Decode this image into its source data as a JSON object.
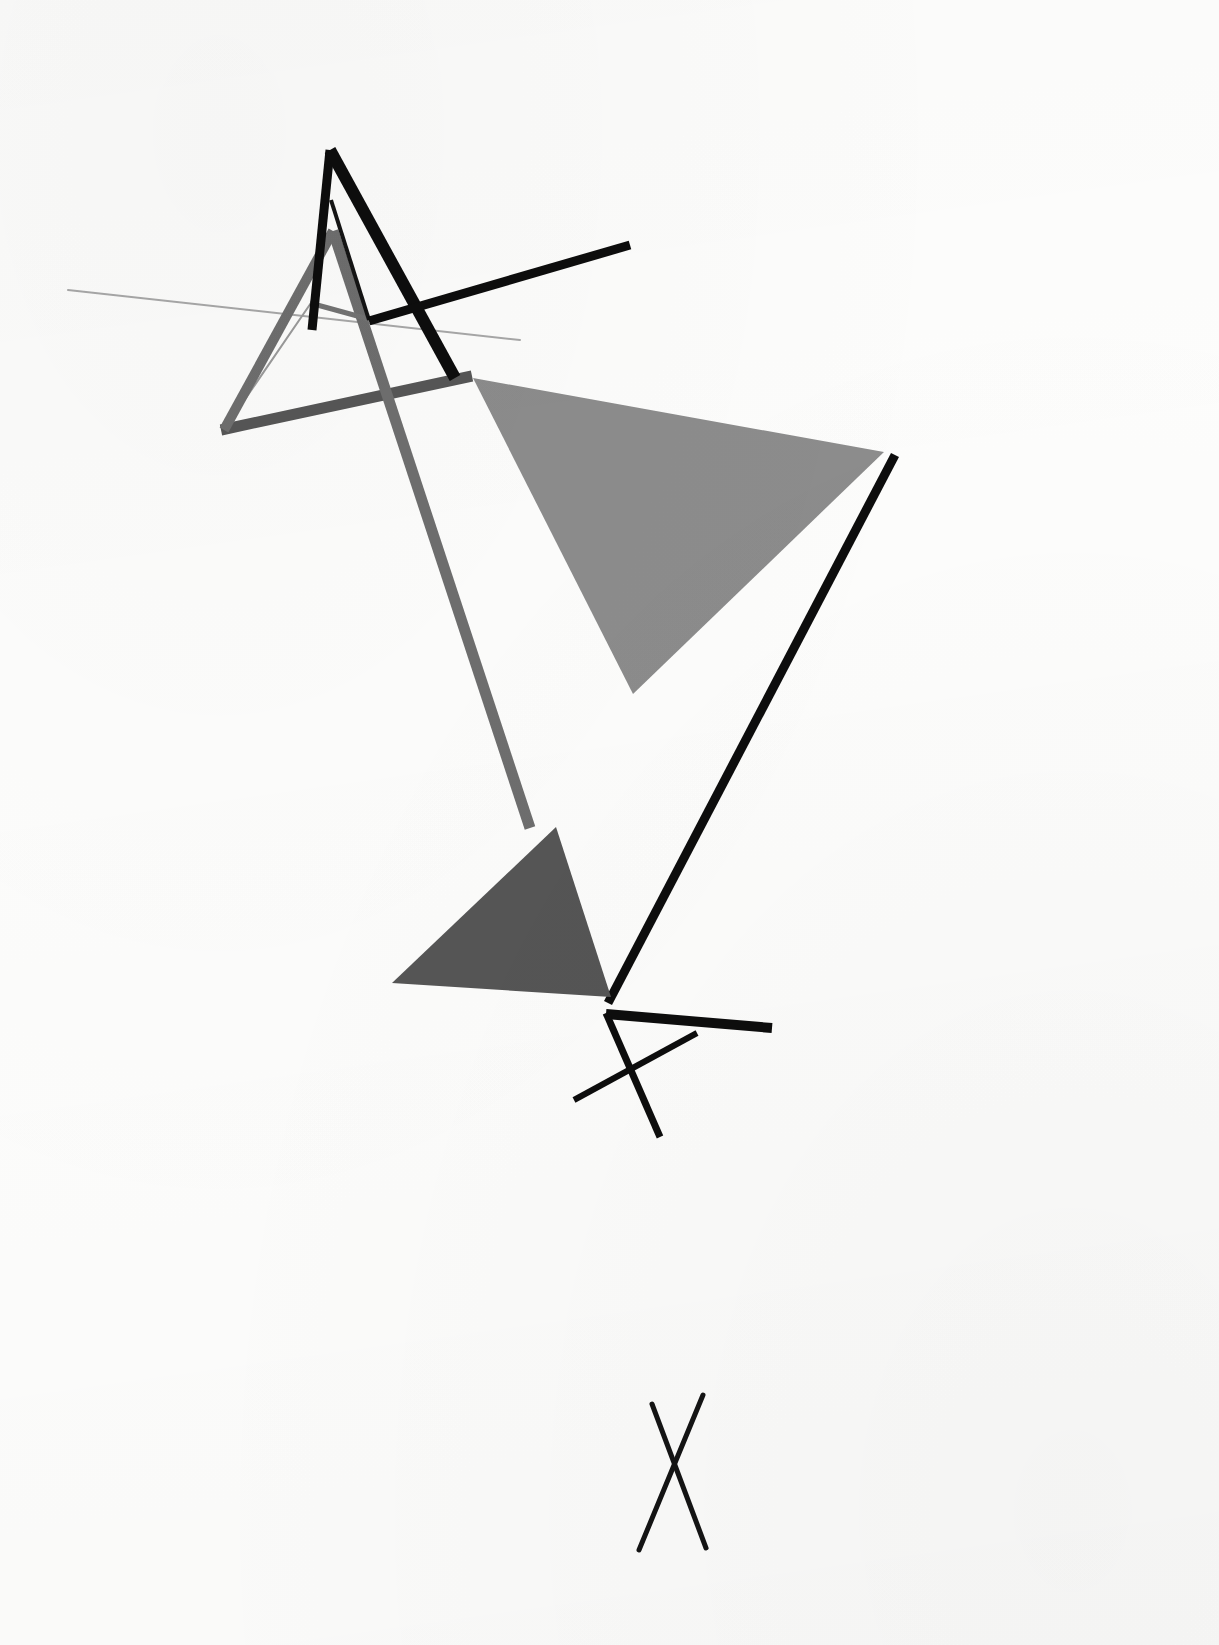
{
  "artwork": {
    "title": "Abstract Geometric Composition",
    "medium": "Constructivist line and plane composition",
    "canvas": {
      "width": 1219,
      "height": 1645
    },
    "background_color": "#fdfdfc"
  },
  "palette": {
    "black": "#0d0d0d",
    "ink": "#141414",
    "dark_gray": "#555555",
    "mid_gray": "#8c8c8c",
    "stroke_gray": "#6e6e6e",
    "light_gray": "#9a9a9a",
    "hairline_gray": "#b4b4b4",
    "paper": "#fdfdfc"
  },
  "shapes": [
    {
      "id": "large-gray-triangle",
      "name": "large-gray-triangle",
      "kind": "filled-triangle",
      "fill": "#8c8c8c",
      "points": "473,378 884,452 633,694",
      "description": "Large mid-gray triangular plane occupying the right of the composition"
    },
    {
      "id": "dark-gray-triangle",
      "name": "dark-gray-triangle",
      "kind": "filled-triangle",
      "fill": "#555555",
      "points": "556,827 611,997 392,983",
      "description": "Smaller dark-gray triangular plane below centre"
    },
    {
      "id": "black-a-left-stroke",
      "name": "black-a-left-stroke",
      "kind": "line",
      "stroke": "#0d0d0d",
      "width": 9,
      "from": "330,150",
      "to": "312,330",
      "description": "Left leg of large black A form"
    },
    {
      "id": "black-a-right-stroke",
      "name": "black-a-right-stroke",
      "kind": "line",
      "stroke": "#0d0d0d",
      "width": 12,
      "from": "330,150",
      "to": "455,378",
      "description": "Right leg of large black A form"
    },
    {
      "id": "black-a-crossbar",
      "name": "black-a-crossbar",
      "kind": "line",
      "stroke": "#0d0d0d",
      "width": 9,
      "from": "369,321",
      "to": "630,245",
      "description": "Black crossbar of the A extending to upper right"
    },
    {
      "id": "gray-a-left-stroke",
      "name": "gray-a-left-stroke",
      "kind": "line",
      "stroke": "#6e6e6e",
      "width": 10,
      "from": "333,231",
      "to": "224,430",
      "description": "Left leg of medium gray A form"
    },
    {
      "id": "gray-a-right-stroke",
      "name": "gray-a-right-stroke",
      "kind": "line",
      "stroke": "#6e6e6e",
      "width": 11,
      "from": "333,231",
      "to": "530,828",
      "description": "Long right leg of gray A descending to lower centre"
    },
    {
      "id": "gray-a-crossbar",
      "name": "gray-a-crossbar",
      "kind": "line",
      "stroke": "#565656",
      "width": 11,
      "from": "221,430",
      "to": "472,376",
      "description": "Lower gray crossbar running left to the A junction"
    },
    {
      "id": "hairline-long-left",
      "name": "hairline-long-left",
      "kind": "line",
      "stroke": "#a8a8a8",
      "width": 2,
      "from": "68,290",
      "to": "520,340",
      "description": "Very thin pale diagonal line sweeping in from far left"
    },
    {
      "id": "hairline-triangle-left",
      "name": "hairline-triangle-left",
      "kind": "line",
      "stroke": "#9a9a9a",
      "width": 2,
      "from": "313,300",
      "to": "226,427",
      "description": "Thin line forming the left side of the small inner triangle"
    },
    {
      "id": "thin-gray-inner-left",
      "name": "thin-gray-inner-left",
      "kind": "line",
      "stroke": "#737373",
      "width": 5,
      "from": "310,303",
      "to": "372,320",
      "description": "Short gray tick at the inner triangle apex"
    },
    {
      "id": "black-inner-v-left",
      "name": "black-inner-v-left",
      "kind": "line",
      "stroke": "#141414",
      "width": 4,
      "from": "331,200",
      "to": "369,320",
      "description": "Thin black inner stroke of the A counter-form"
    },
    {
      "id": "black-long-diagonal",
      "name": "black-long-diagonal",
      "kind": "line",
      "stroke": "#0d0d0d",
      "width": 9,
      "from": "895,455",
      "to": "608,1003",
      "description": "Long black diagonal descending from right to lower centre"
    },
    {
      "id": "black-lower-horizontal",
      "name": "black-lower-horizontal",
      "kind": "line",
      "stroke": "#0d0d0d",
      "width": 10,
      "from": "606,1014",
      "to": "772,1028",
      "description": "Short thick black bar running right from the lower node"
    },
    {
      "id": "black-lower-x-descender",
      "name": "black-lower-x-descender",
      "kind": "line",
      "stroke": "#0d0d0d",
      "width": 7,
      "from": "606,1013",
      "to": "660,1137",
      "description": "Black stroke descending from node to lower right"
    },
    {
      "id": "black-lower-x-crossing",
      "name": "black-lower-x-crossing",
      "kind": "line",
      "stroke": "#0d0d0d",
      "width": 6,
      "from": "574,1100",
      "to": "697,1033",
      "description": "Black stroke crossing the descender to form an X"
    },
    {
      "id": "bottom-x-left-stroke",
      "name": "bottom-x-left-stroke",
      "kind": "line",
      "stroke": "#141414",
      "width": 5,
      "from": "652,1404",
      "to": "706,1548",
      "description": "Left stroke of the isolated X mark at the bottom"
    },
    {
      "id": "bottom-x-right-stroke",
      "name": "bottom-x-right-stroke",
      "kind": "line",
      "stroke": "#141414",
      "width": 5,
      "from": "703,1395",
      "to": "639,1550",
      "description": "Right stroke of the isolated X mark at the bottom"
    }
  ]
}
